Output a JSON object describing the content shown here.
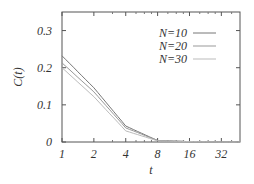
{
  "chart_data": {
    "type": "line",
    "title": "",
    "xlabel": "t",
    "ylabel": "C(t)",
    "xscale": "log2",
    "x_ticks": [
      "1",
      "2",
      "4",
      "8",
      "16",
      "32"
    ],
    "y_ticks": [
      "0",
      "0.1",
      "0.2",
      "0.3"
    ],
    "xlim": [
      1,
      48
    ],
    "ylim": [
      0,
      0.35
    ],
    "grid": false,
    "legend_position": "upper right",
    "x": [
      1,
      2,
      4,
      8,
      16,
      32,
      48
    ],
    "series": [
      {
        "name": "N=10",
        "color": "#777777",
        "values": [
          0.232,
          0.146,
          0.043,
          0.004,
          0.001,
          0.0,
          0.0
        ]
      },
      {
        "name": "N=20",
        "color": "#999999",
        "values": [
          0.213,
          0.135,
          0.038,
          0.004,
          0.001,
          0.0,
          0.0
        ]
      },
      {
        "name": "N=30",
        "color": "#bbbbbb",
        "values": [
          0.2,
          0.122,
          0.03,
          0.003,
          0.001,
          0.0,
          0.0
        ]
      }
    ]
  }
}
